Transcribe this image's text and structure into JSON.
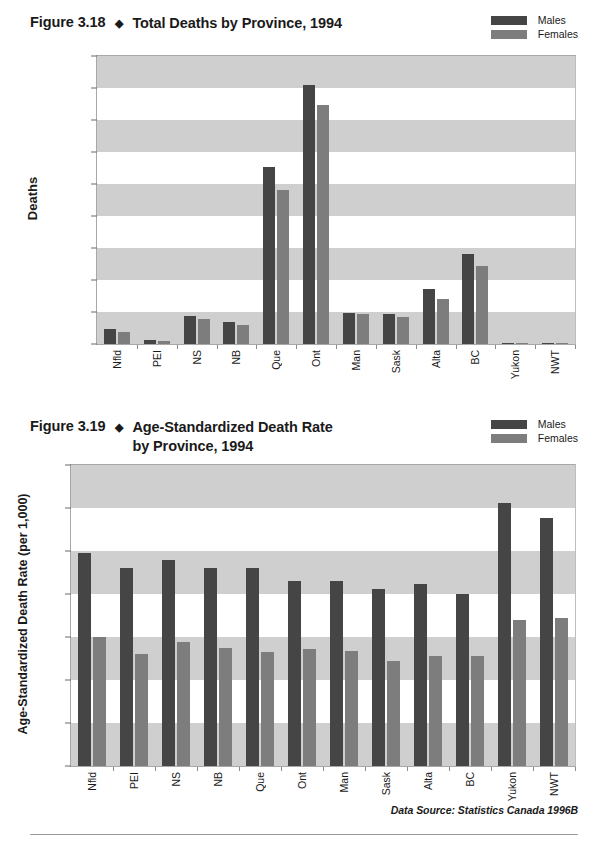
{
  "page": {
    "background": "#ffffff",
    "bottom_rule": true
  },
  "colors": {
    "males": "#454545",
    "females": "#7d7d7d",
    "band": "#cfcfcf",
    "axis": "#6a6a6a",
    "text": "#1a1a1a"
  },
  "legend": {
    "males_label": "Males",
    "females_label": "Females"
  },
  "figure1": {
    "figure_number": "Figure 3.18",
    "diamond": "◆",
    "title": "Total Deaths by Province, 1994"
  },
  "figure2": {
    "figure_number": "Figure 3.19",
    "diamond": "◆",
    "title": "Age-Standardized Death Rate\nby Province, 1994",
    "source_note": "Data Source: Statistics Canada 1996B"
  },
  "chart_data": [
    {
      "id": "figure-3-18",
      "type": "bar",
      "title": "Figure 3.18 ◆ Total Deaths by Province, 1994",
      "xlabel": "",
      "ylabel": "Deaths",
      "ylim": [
        0,
        45000
      ],
      "yticks": [
        0,
        5000,
        10000,
        15000,
        20000,
        25000,
        30000,
        35000,
        40000,
        45000
      ],
      "ytick_labels": [
        "0",
        "5,000",
        "10,000",
        "15,000",
        "20,000",
        "25,000",
        "30,000",
        "35,000",
        "40,000",
        "45,000"
      ],
      "grid": "horizontal-bands",
      "legend_position": "top-right",
      "categories": [
        "Nfld",
        "PEI",
        "NS",
        "NB",
        "Que",
        "Ont",
        "Man",
        "Sask",
        "Alta",
        "BC",
        "Yukon",
        "NWT"
      ],
      "series": [
        {
          "name": "Males",
          "color": "#454545",
          "values": [
            2300,
            600,
            4300,
            3450,
            27600,
            40400,
            4900,
            4750,
            8650,
            14000,
            120,
            200
          ]
        },
        {
          "name": "Females",
          "color": "#7d7d7d",
          "values": [
            1850,
            500,
            3900,
            2900,
            24000,
            37300,
            4650,
            4200,
            7000,
            12200,
            80,
            150
          ]
        }
      ]
    },
    {
      "id": "figure-3-19",
      "type": "bar",
      "title": "Figure 3.19 ◆ Age-Standardized Death Rate by Province, 1994",
      "xlabel": "",
      "ylabel": "Age-Standardized Death Rate (per 1,000)",
      "ylim": [
        0,
        14
      ],
      "yticks": [
        0,
        2,
        4,
        6,
        8,
        10,
        12,
        14
      ],
      "ytick_labels": [
        "0",
        "2",
        "4",
        "6",
        "8",
        "10",
        "12",
        "14"
      ],
      "grid": "horizontal-bands",
      "legend_position": "top-right",
      "annotation": "Data Source: Statistics Canada 1996B",
      "categories": [
        "Nfld",
        "PEI",
        "NS",
        "NB",
        "Que",
        "Ont",
        "Man",
        "Sask",
        "Alta",
        "BC",
        "Yukon",
        "NWT"
      ],
      "series": [
        {
          "name": "Males",
          "color": "#454545",
          "values": [
            9.9,
            9.2,
            9.6,
            9.2,
            9.2,
            8.6,
            8.6,
            8.25,
            8.45,
            8.0,
            12.25,
            11.55
          ]
        },
        {
          "name": "Females",
          "color": "#7d7d7d",
          "values": [
            6.0,
            5.2,
            5.75,
            5.5,
            5.3,
            5.45,
            5.35,
            4.9,
            5.1,
            5.1,
            6.8,
            6.9
          ]
        }
      ]
    }
  ]
}
